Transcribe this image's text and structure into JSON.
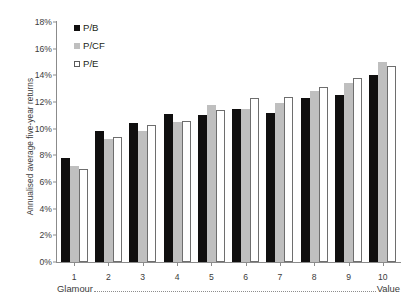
{
  "chart_data": {
    "type": "bar",
    "title": "",
    "xlabel": "",
    "ylabel": "Annualised average five-year returns",
    "categories": [
      "1",
      "2",
      "3",
      "4",
      "5",
      "6",
      "7",
      "8",
      "9",
      "10"
    ],
    "series": [
      {
        "name": "P/B",
        "color": "#100f0f",
        "values": [
          7.8,
          9.8,
          10.4,
          11.1,
          11.0,
          11.5,
          11.2,
          12.3,
          12.5,
          14.0
        ]
      },
      {
        "name": "P/CF",
        "color": "#bfbfbf",
        "values": [
          7.2,
          9.2,
          9.8,
          10.5,
          11.8,
          11.5,
          11.9,
          12.8,
          13.4,
          15.0
        ]
      },
      {
        "name": "P/E",
        "color": "#ffffff",
        "values": [
          7.0,
          9.4,
          10.3,
          10.6,
          11.4,
          12.3,
          12.4,
          13.1,
          13.8,
          14.7
        ]
      }
    ],
    "ylim": [
      0,
      18
    ],
    "ytick_labels": [
      "0%",
      "2%",
      "4%",
      "6%",
      "8%",
      "10%",
      "12%",
      "14%",
      "16%",
      "18%"
    ],
    "ytick_values": [
      0,
      2,
      4,
      6,
      8,
      10,
      12,
      14,
      16,
      18
    ],
    "grid": false,
    "legend_position": "top-left",
    "legend_entries": [
      "P/B",
      "P/CF",
      "P/E"
    ],
    "annotations": {
      "range_left": "Glamour",
      "range_right": "Value"
    }
  }
}
